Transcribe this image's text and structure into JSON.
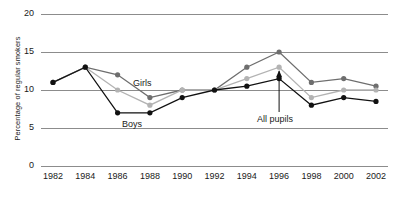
{
  "chart_data": {
    "type": "line",
    "title": "",
    "xlabel": "",
    "ylabel": "Percentage of regular smokers",
    "x": [
      1982,
      1984,
      1986,
      1988,
      1990,
      1992,
      1994,
      1996,
      1998,
      2000,
      2002
    ],
    "xticklabels": [
      "1982",
      "1984",
      "1986",
      "1988",
      "1990",
      "1992",
      "1994",
      "1996",
      "1998",
      "2000",
      "2002"
    ],
    "yticklabels": [
      "0",
      "5",
      "10",
      "15",
      "20"
    ],
    "yticks": [
      0,
      5,
      10,
      15,
      20
    ],
    "ylim": [
      0,
      20
    ],
    "grid": "horizontal",
    "legend": "inline-annotations",
    "series": [
      {
        "name": "Girls",
        "color": "#6e6e6e",
        "values": [
          11,
          13,
          12,
          9,
          10,
          10,
          13,
          15,
          11,
          11.5,
          10.5
        ]
      },
      {
        "name": "All pupils",
        "color": "#b3b3b3",
        "values": [
          11,
          13,
          10,
          8,
          10,
          10,
          11.5,
          13,
          9,
          10,
          10
        ]
      },
      {
        "name": "Boys",
        "color": "#111111",
        "values": [
          11,
          13,
          7,
          7,
          9,
          10,
          10.5,
          11.5,
          8,
          9,
          8.5
        ]
      }
    ],
    "annotations": [
      {
        "text": "Girls",
        "series": "Girls"
      },
      {
        "text": "Boys",
        "series": "Boys"
      },
      {
        "text": "All pupils",
        "series": "All pupils",
        "points_to_year": 1996
      }
    ]
  },
  "colors": {
    "girls": "#6e6e6e",
    "all_pupils": "#b3b3b3",
    "boys": "#111111",
    "gridline": "#8c8c8c",
    "text": "#1a1a1a",
    "background": "#ffffff"
  }
}
